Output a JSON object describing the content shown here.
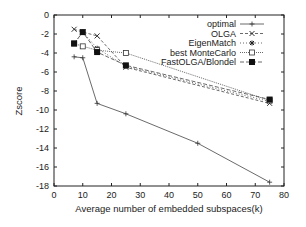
{
  "chart_data": {
    "type": "line",
    "title": "",
    "xlabel": "Average number of embedded subspaces(k)",
    "ylabel": "Zscore",
    "xlim": [
      0,
      80
    ],
    "ylim": [
      -18,
      0
    ],
    "xticks": [
      0,
      10,
      20,
      30,
      40,
      50,
      60,
      70,
      80
    ],
    "yticks": [
      0,
      -2,
      -4,
      -6,
      -8,
      -10,
      -12,
      -14,
      -16,
      -18
    ],
    "grid": false,
    "legend_position": "upper right",
    "series": [
      {
        "name": "optimal",
        "marker": "plus",
        "dash": "",
        "x": [
          7,
          10,
          15,
          25,
          50,
          75
        ],
        "values": [
          -4.4,
          -4.5,
          -9.3,
          -10.4,
          -13.5,
          -17.6
        ]
      },
      {
        "name": "OLGA",
        "marker": "cross",
        "dash": "3,2",
        "x": [
          7,
          10,
          15,
          25,
          75
        ],
        "values": [
          -1.5,
          -1.8,
          -2.2,
          -5.5,
          -9.3
        ]
      },
      {
        "name": "EigenMatch",
        "marker": "star",
        "dash": "1,2",
        "x": [
          7,
          10,
          15,
          25,
          75
        ],
        "values": [
          -3.0,
          -1.8,
          -3.5,
          -5.4,
          -9.1
        ]
      },
      {
        "name": "best MonteCarlo",
        "marker": "open-square",
        "dash": "1,1",
        "x": [
          7,
          10,
          15,
          25,
          75
        ],
        "values": [
          -3.0,
          -3.3,
          -3.7,
          -4.0,
          -9.0
        ]
      },
      {
        "name": "FastOLGA/Blondel",
        "marker": "filled-square",
        "dash": "4,2",
        "x": [
          7,
          10,
          15,
          25,
          75
        ],
        "values": [
          -3.0,
          -1.8,
          -3.9,
          -5.3,
          -8.9
        ]
      }
    ]
  }
}
